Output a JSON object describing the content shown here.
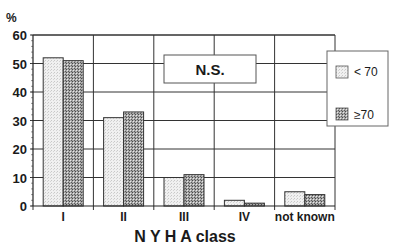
{
  "chart_data": {
    "type": "bar",
    "title": "",
    "ylabel": "%",
    "xlabel": "N Y H A class",
    "categories": [
      "I",
      "II",
      "III",
      "IV",
      "not known"
    ],
    "series": [
      {
        "name": "< 70",
        "values": [
          52,
          31,
          10,
          2,
          5
        ],
        "pattern": "light"
      },
      {
        "name": "≥70",
        "values": [
          51,
          33,
          11,
          1,
          4
        ],
        "pattern": "dark"
      }
    ],
    "ylim": [
      0,
      60
    ],
    "yticks": [
      0,
      10,
      20,
      30,
      40,
      50,
      60
    ],
    "grid": true,
    "legend_position": "right",
    "annotation": "N.S."
  },
  "legend": {
    "items": [
      "< 70",
      "≥70"
    ]
  },
  "annotation": "N.S.",
  "axis": {
    "ylabel": "%",
    "xlabel": "N Y H A class"
  }
}
